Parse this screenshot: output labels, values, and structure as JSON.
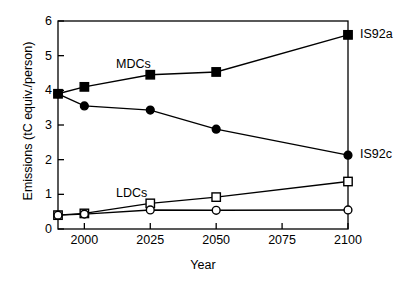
{
  "chart_data": {
    "type": "line",
    "title": "",
    "xlabel": "Year",
    "ylabel": "Emissions (tC equiv./person)",
    "x": [
      1990,
      2000,
      2025,
      2050,
      2100
    ],
    "xlim": [
      1990,
      2100
    ],
    "ylim": [
      0,
      6
    ],
    "xticks": [
      2000,
      2025,
      2050,
      2075,
      2100
    ],
    "yticks": [
      0,
      1,
      2,
      3,
      4,
      5,
      6
    ],
    "grid": false,
    "legend_position": "inline-annotations",
    "series": [
      {
        "name": "MDCs IS92a",
        "group": "MDCs",
        "scenario": "IS92a",
        "marker": "filled-square",
        "values": [
          3.9,
          4.1,
          4.45,
          4.53,
          5.6
        ]
      },
      {
        "name": "MDCs IS92c",
        "group": "MDCs",
        "scenario": "IS92c",
        "marker": "filled-circle",
        "values": [
          3.9,
          3.55,
          3.43,
          2.88,
          2.13
        ]
      },
      {
        "name": "LDCs IS92a",
        "group": "LDCs",
        "scenario": "IS92a",
        "marker": "open-square",
        "values": [
          0.4,
          0.45,
          0.74,
          0.92,
          1.37
        ]
      },
      {
        "name": "LDCs IS92c",
        "group": "LDCs",
        "scenario": "IS92c",
        "marker": "open-circle",
        "values": [
          0.4,
          0.43,
          0.55,
          0.54,
          0.55
        ]
      }
    ],
    "annotations": [
      {
        "text": "MDCs",
        "x": 2012,
        "y": 4.72
      },
      {
        "text": "LDCs",
        "x": 2012,
        "y": 1.0
      },
      {
        "text": "IS92a",
        "x": 2100,
        "y": 5.6,
        "side": "right"
      },
      {
        "text": "IS92c",
        "x": 2100,
        "y": 2.13,
        "side": "right"
      }
    ]
  },
  "colors": {
    "axis": "#000000",
    "line": "#000000",
    "marker_fill": "#000000",
    "marker_open_fill": "#ffffff",
    "background": "#ffffff"
  }
}
